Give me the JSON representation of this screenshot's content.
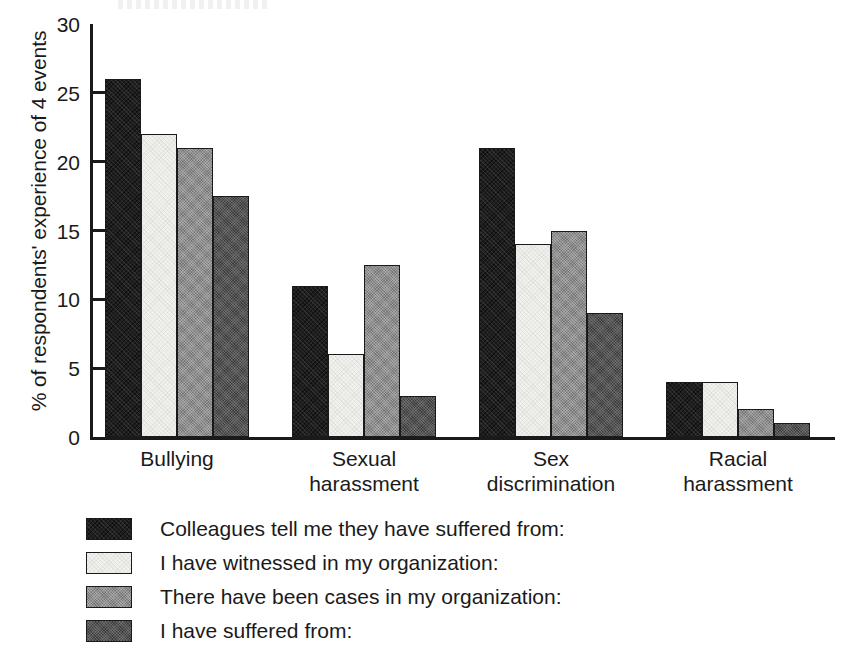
{
  "chart_data": {
    "type": "bar",
    "title": "",
    "xlabel": "",
    "ylabel": "% of respondents' experience of 4 events",
    "ylim": [
      0,
      30
    ],
    "yticks": [
      0,
      5,
      10,
      15,
      20,
      25,
      30
    ],
    "grid": false,
    "legend_position": "below",
    "categories": [
      "Bullying",
      "Sexual harassment",
      "Sex discrimination",
      "Racial harassment"
    ],
    "category_lines": [
      [
        "Bullying"
      ],
      [
        "Sexual",
        "harassment"
      ],
      [
        "Sex",
        "discrimination"
      ],
      [
        "Racial",
        "harassment"
      ]
    ],
    "series": [
      {
        "name": "Colleagues tell me they have suffered from:",
        "color": "#1e1e1e",
        "values": [
          26,
          11,
          21,
          4
        ]
      },
      {
        "name": "I have witnessed in my organization:",
        "color": "#f1f1ee",
        "values": [
          22,
          6,
          14,
          4
        ]
      },
      {
        "name": "There have been cases in my organization:",
        "color": "#8f8f8f",
        "values": [
          21,
          12.5,
          15,
          2
        ]
      },
      {
        "name": "I have suffered from:",
        "color": "#545454",
        "values": [
          17.5,
          3,
          9,
          1
        ]
      }
    ]
  }
}
